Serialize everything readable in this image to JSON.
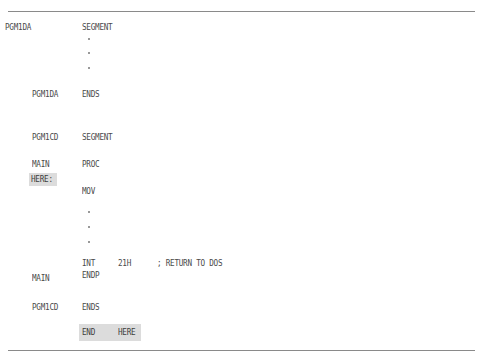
{
  "listing": {
    "lines": {
      "data_seg_label": "PGM1DA",
      "data_seg_directive": "SEGMENT",
      "data_seg_end_label": "PGM1DA",
      "data_seg_end_directive": "ENDS",
      "code_seg_label": "PGM1CD",
      "code_seg_directive": "SEGMENT",
      "proc_label": "MAIN",
      "proc_directive": "PROC",
      "entry_label": "HERE:",
      "mov_instr": "MOV",
      "int_instr": "INT",
      "int_operand": "21H",
      "int_comment": "; RETURN TO DOS",
      "endp_label": "MAIN",
      "endp_directive": "ENDP",
      "code_seg_end_label": "PGM1CD",
      "code_seg_end_directive": "ENDS",
      "end_directive": "END",
      "end_operand": "HERE"
    },
    "ellipsis_groups": 2,
    "highlight_color": "#dcdcdc",
    "text_color": "#4a4a4a"
  }
}
